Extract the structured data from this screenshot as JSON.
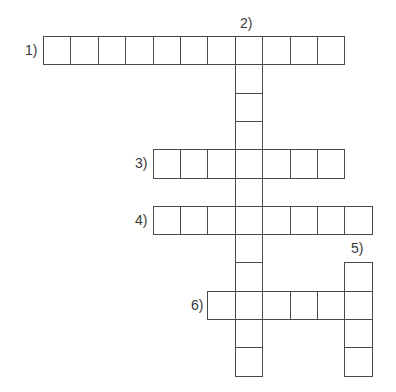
{
  "puzzle": {
    "grid": {
      "origin_x": 43,
      "origin_y": 36,
      "cell_width": 27.4,
      "cell_height": 28.3,
      "line_color": "#4a4a4a"
    },
    "words": [
      {
        "number": 1,
        "label": "1)",
        "direction": "across",
        "row": 0,
        "col": 0,
        "length": 11,
        "label_x": 25,
        "label_y": 43
      },
      {
        "number": 2,
        "label": "2)",
        "direction": "down",
        "row": 0,
        "col": 7,
        "length": 12,
        "label_x": 240,
        "label_y": 16
      },
      {
        "number": 3,
        "label": "3)",
        "direction": "across",
        "row": 4,
        "col": 4,
        "length": 7,
        "label_x": 135,
        "label_y": 156
      },
      {
        "number": 4,
        "label": "4)",
        "direction": "across",
        "row": 6,
        "col": 4,
        "length": 8,
        "label_x": 135,
        "label_y": 213
      },
      {
        "number": 5,
        "label": "5)",
        "direction": "down",
        "row": 8,
        "col": 11,
        "length": 4,
        "label_x": 351,
        "label_y": 241
      },
      {
        "number": 6,
        "label": "6)",
        "direction": "across",
        "row": 9,
        "col": 6,
        "length": 6,
        "label_x": 191,
        "label_y": 298
      }
    ]
  }
}
